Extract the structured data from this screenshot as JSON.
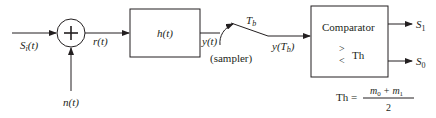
{
  "diagram": {
    "input_signal": {
      "base": "S",
      "sub": "i",
      "suffix": "(t)"
    },
    "noise": "n(t)",
    "summer_symbol": "+",
    "received": "r(t)",
    "filter": {
      "label": "h(t)"
    },
    "filter_output": "y(t)",
    "sampler": {
      "label": "(sampler)",
      "time_base": "T",
      "time_sub": "b"
    },
    "sampled_output": {
      "prefix": "y(",
      "base": "T",
      "sub": "b",
      "suffix": ")"
    },
    "comparator": {
      "title": "Comparator",
      "gt": ">",
      "lt": "<",
      "threshold_label": "Th"
    },
    "outputs": [
      {
        "base": "S",
        "sub": "1"
      },
      {
        "base": "S",
        "sub": "0"
      }
    ],
    "threshold_formula": {
      "lhs": "Th =",
      "num_a": "m",
      "num_a_sub": "0",
      "plus": "+",
      "num_b": "m",
      "num_b_sub": "1",
      "denominator": "2"
    },
    "colors": {
      "stroke": "#231f20",
      "background": "#ffffff"
    }
  }
}
